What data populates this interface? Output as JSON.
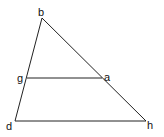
{
  "diagram": {
    "type": "triangle-with-parallel-segment",
    "stroke_color": "#222222",
    "label_color": "#111111",
    "background": "#ffffff",
    "vertices": {
      "b": {
        "label": "b",
        "x": 42,
        "y": 18
      },
      "g": {
        "label": "g",
        "x": 27,
        "y": 78
      },
      "a": {
        "label": "a",
        "x": 102,
        "y": 78
      },
      "d": {
        "label": "d",
        "x": 15,
        "y": 121
      },
      "h": {
        "label": "h",
        "x": 146,
        "y": 121
      }
    },
    "segments": [
      {
        "from": "b",
        "to": "d"
      },
      {
        "from": "b",
        "to": "h"
      },
      {
        "from": "d",
        "to": "h"
      },
      {
        "from": "g",
        "to": "a"
      }
    ],
    "labels": {
      "b": "b",
      "g": "g",
      "a": "a",
      "d": "d",
      "h": "h"
    }
  }
}
